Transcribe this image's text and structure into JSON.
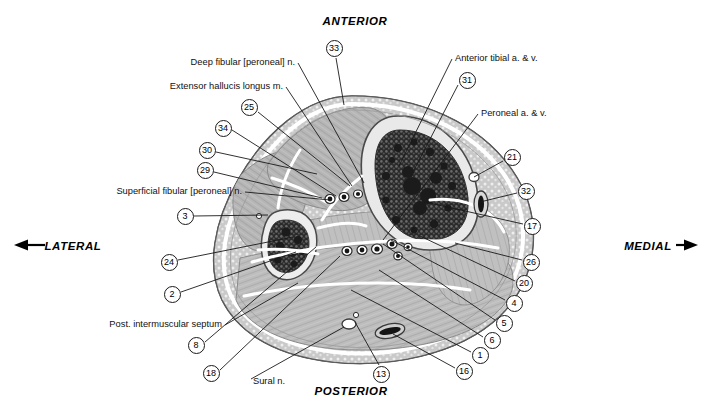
{
  "figure": {
    "type": "anatomical-cross-section",
    "region": "leg (crus) transverse section",
    "orientation_labels": [
      {
        "name": "anterior",
        "text": "ANTERIOR",
        "x": 355,
        "y": 22,
        "align": "center"
      },
      {
        "name": "posterior",
        "text": "POSTERIOR",
        "x": 351,
        "y": 392,
        "align": "center"
      },
      {
        "name": "lateral",
        "text": "LATERAL",
        "x": 73,
        "y": 247,
        "align": "center",
        "arrow": "left"
      },
      {
        "name": "medial",
        "text": "MEDIAL",
        "x": 648,
        "y": 247,
        "align": "center",
        "arrow": "right"
      }
    ],
    "text_labels": [
      {
        "name": "deep-fibular-nerve",
        "text": "Deep fibular [peroneal] n.",
        "x": 295,
        "y": 63,
        "anchor": "end",
        "leader": [
          [
            298,
            63
          ],
          [
            364,
            183
          ]
        ]
      },
      {
        "name": "extensor-hallucis-longus",
        "text": "Extensor hallucis longus m.",
        "x": 283,
        "y": 87,
        "anchor": "end",
        "leader": [
          [
            286,
            87
          ],
          [
            352,
            186
          ]
        ]
      },
      {
        "name": "superficial-fibular-nerve",
        "text": "Superficial fibular [peroneal] n.",
        "x": 242,
        "y": 192,
        "anchor": "end",
        "leader": [
          [
            245,
            192
          ],
          [
            330,
            200
          ]
        ]
      },
      {
        "name": "post-intermuscular-septum",
        "text": "Post. intermuscular septum",
        "x": 222,
        "y": 325,
        "anchor": "end",
        "leader": [
          [
            225,
            325
          ],
          [
            298,
            283
          ]
        ]
      },
      {
        "name": "sural-nerve",
        "text": "Sural n.",
        "x": 253,
        "y": 382,
        "anchor": "start",
        "leader": [
          [
            251,
            379
          ],
          [
            344,
            327
          ]
        ]
      },
      {
        "name": "anterior-tibial-vessels",
        "text": "Anterior tibial a. & v.",
        "x": 455,
        "y": 59,
        "anchor": "start",
        "leader": [
          [
            452,
            59
          ],
          [
            399,
            166
          ]
        ]
      },
      {
        "name": "peroneal-vessels",
        "text": "Peroneal a. & v.",
        "x": 481,
        "y": 114,
        "anchor": "start",
        "leader": [
          [
            478,
            114
          ],
          [
            383,
            240
          ]
        ]
      }
    ],
    "numbered_callouts": [
      {
        "name": "callout-33",
        "number": "33",
        "cx": 334,
        "cy": 48,
        "leader": [
          [
            336,
            58
          ],
          [
            344,
            105
          ]
        ]
      },
      {
        "name": "callout-31",
        "number": "31",
        "cx": 467,
        "cy": 80,
        "leader": [
          [
            458,
            85
          ],
          [
            413,
            172
          ]
        ]
      },
      {
        "name": "callout-25",
        "number": "25",
        "cx": 249,
        "cy": 107,
        "leader": [
          [
            258,
            112
          ],
          [
            350,
            186
          ]
        ]
      },
      {
        "name": "callout-34",
        "number": "34",
        "cx": 223,
        "cy": 128,
        "leader": [
          [
            232,
            130
          ],
          [
            336,
            196
          ]
        ]
      },
      {
        "name": "callout-30",
        "number": "30",
        "cx": 207,
        "cy": 150,
        "leader": [
          [
            216,
            152
          ],
          [
            317,
            174
          ]
        ]
      },
      {
        "name": "callout-29",
        "number": "29",
        "cx": 205,
        "cy": 170,
        "leader": [
          [
            214,
            172
          ],
          [
            322,
            198
          ]
        ]
      },
      {
        "name": "callout-21",
        "number": "21",
        "cx": 512,
        "cy": 157,
        "leader": [
          [
            503,
            161
          ],
          [
            474,
            177
          ]
        ]
      },
      {
        "name": "callout-32",
        "number": "32",
        "cx": 526,
        "cy": 191,
        "leader": [
          [
            517,
            193
          ],
          [
            480,
            202
          ]
        ]
      },
      {
        "name": "callout-3",
        "number": "3",
        "cx": 185,
        "cy": 216,
        "leader": [
          [
            194,
            216
          ],
          [
            268,
            215
          ]
        ]
      },
      {
        "name": "callout-17",
        "number": "17",
        "cx": 532,
        "cy": 226,
        "leader": [
          [
            523,
            224
          ],
          [
            425,
            202
          ]
        ]
      },
      {
        "name": "callout-24",
        "number": "24",
        "cx": 169,
        "cy": 262,
        "leader": [
          [
            178,
            260
          ],
          [
            293,
            237
          ]
        ]
      },
      {
        "name": "callout-26",
        "number": "26",
        "cx": 531,
        "cy": 262,
        "leader": [
          [
            522,
            260
          ],
          [
            455,
            243
          ]
        ]
      },
      {
        "name": "callout-20",
        "number": "20",
        "cx": 524,
        "cy": 283,
        "leader": [
          [
            515,
            281
          ],
          [
            420,
            236
          ]
        ]
      },
      {
        "name": "callout-2",
        "number": "2",
        "cx": 172,
        "cy": 294,
        "leader": [
          [
            181,
            292
          ],
          [
            296,
            252
          ]
        ]
      },
      {
        "name": "callout-4",
        "number": "4",
        "cx": 514,
        "cy": 303,
        "leader": [
          [
            505,
            300
          ],
          [
            391,
            240
          ]
        ]
      },
      {
        "name": "callout-5",
        "number": "5",
        "cx": 504,
        "cy": 323,
        "leader": [
          [
            495,
            320
          ],
          [
            383,
            244
          ]
        ]
      },
      {
        "name": "callout-8",
        "number": "8",
        "cx": 196,
        "cy": 345,
        "leader": [
          [
            205,
            342
          ],
          [
            316,
            247
          ]
        ]
      },
      {
        "name": "callout-6",
        "number": "6",
        "cx": 492,
        "cy": 340,
        "leader": [
          [
            483,
            337
          ],
          [
            379,
            270
          ]
        ]
      },
      {
        "name": "callout-1",
        "number": "1",
        "cx": 480,
        "cy": 355,
        "leader": [
          [
            471,
            352
          ],
          [
            351,
            290
          ]
        ]
      },
      {
        "name": "callout-18",
        "number": "18",
        "cx": 211,
        "cy": 373,
        "leader": [
          [
            220,
            370
          ],
          [
            340,
            256
          ]
        ]
      },
      {
        "name": "callout-13",
        "number": "13",
        "cx": 381,
        "cy": 374,
        "leader": [
          [
            379,
            365
          ],
          [
            355,
            322
          ]
        ]
      },
      {
        "name": "callout-16",
        "number": "16",
        "cx": 464,
        "cy": 371,
        "leader": [
          [
            455,
            368
          ],
          [
            393,
            334
          ]
        ]
      }
    ],
    "palette": {
      "bone_dark": "#3a3a3a",
      "muscle_mid": "#b8b8b8",
      "muscle_light": "#cfcfcf",
      "fascia_white": "#ffffff",
      "subcutaneous": "#c6c6c6",
      "outline": "#4a4a4a",
      "leader_line": "#1a1a1a",
      "background": "#ffffff"
    }
  }
}
